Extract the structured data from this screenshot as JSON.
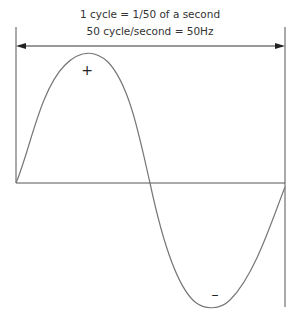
{
  "diagram": {
    "caption_line1": "1 cycle = 1/50 of a second",
    "caption_line2": "50 cycle/second = 50Hz",
    "positive_label": "+",
    "negative_label": "–",
    "line_color": "#555555",
    "wave_color": "#777777"
  }
}
